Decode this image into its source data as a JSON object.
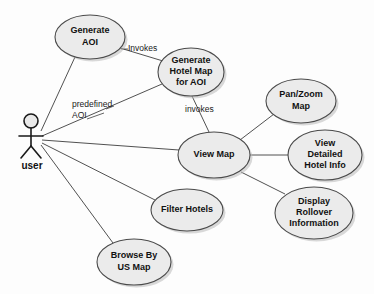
{
  "diagram": {
    "type": "uml-use-case-diagram",
    "background_color": "#fdfdfd",
    "ellipse_fill": "#ebebeb",
    "ellipse_stroke": "#4a4a4a",
    "line_color": "#3d3d3d",
    "text_color": "#111111"
  },
  "actor": {
    "name": "user",
    "label": "user",
    "x": 31,
    "y": 137
  },
  "use_cases": [
    {
      "id": "generate-aoi",
      "lines": [
        "Generate",
        "AOI"
      ],
      "cx": 90,
      "cy": 37,
      "rx": 35,
      "ry": 22
    },
    {
      "id": "generate-hotel-map-for-aoi",
      "lines": [
        "Generate",
        "Hotel Map",
        "for AOI"
      ],
      "cx": 191,
      "cy": 72,
      "rx": 33,
      "ry": 24
    },
    {
      "id": "pan-zoom-map",
      "lines": [
        "Pan/Zoom",
        "Map"
      ],
      "cx": 301,
      "cy": 101,
      "rx": 35,
      "ry": 22
    },
    {
      "id": "view-map",
      "lines": [
        "View Map"
      ],
      "cx": 214,
      "cy": 155,
      "rx": 36,
      "ry": 23
    },
    {
      "id": "view-detailed-hotel-info",
      "lines": [
        "View",
        "Detailed",
        "Hotel Info"
      ],
      "cx": 325,
      "cy": 155,
      "rx": 37,
      "ry": 25
    },
    {
      "id": "filter-hotels",
      "lines": [
        "Filter Hotels"
      ],
      "cx": 187,
      "cy": 210,
      "rx": 36,
      "ry": 21
    },
    {
      "id": "display-rollover-information",
      "lines": [
        "Display",
        "Rollover",
        "Information"
      ],
      "cx": 314,
      "cy": 213,
      "rx": 39,
      "ry": 26
    },
    {
      "id": "browse-by-us-map",
      "lines": [
        "Browse By",
        "US Map"
      ],
      "cx": 134,
      "cy": 262,
      "rx": 37,
      "ry": 23
    }
  ],
  "associations": [
    {
      "id": "user-to-generate-aoi",
      "from": "user",
      "to": "generate-aoi",
      "label": ""
    },
    {
      "id": "user-to-generate-hotel-map",
      "from": "user",
      "to": "generate-hotel-map-for-aoi",
      "label": "predefined AOI"
    },
    {
      "id": "user-to-view-map",
      "from": "user",
      "to": "view-map",
      "label": ""
    },
    {
      "id": "user-to-filter-hotels",
      "from": "user",
      "to": "filter-hotels",
      "label": ""
    },
    {
      "id": "user-to-browse-by-us-map",
      "from": "user",
      "to": "browse-by-us-map",
      "label": ""
    },
    {
      "id": "generate-aoi-to-generate-hotel-map",
      "from": "generate-aoi",
      "to": "generate-hotel-map-for-aoi",
      "label": "Invokes"
    },
    {
      "id": "generate-hotel-map-to-view-map",
      "from": "generate-hotel-map-for-aoi",
      "to": "view-map",
      "label": "invokes"
    },
    {
      "id": "view-map-to-pan-zoom-map",
      "from": "view-map",
      "to": "pan-zoom-map",
      "label": ""
    },
    {
      "id": "view-map-to-view-detailed-hotel-info",
      "from": "view-map",
      "to": "view-detailed-hotel-info",
      "label": ""
    },
    {
      "id": "view-map-to-display-rollover-information",
      "from": "view-map",
      "to": "display-rollover-information",
      "label": ""
    }
  ],
  "edge_labels": {
    "invokes_upper": "Invokes",
    "invokes_lower": "invokes",
    "predefined_line1": "predefined",
    "predefined_line2": "AOI"
  }
}
